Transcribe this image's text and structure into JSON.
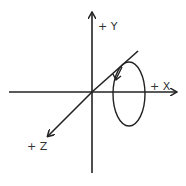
{
  "diagram": {
    "title": "",
    "type": "3d-coordinate-axes-with-rotation",
    "labels": {
      "y": "+ Y",
      "x": "+ X",
      "z": "+ Z"
    },
    "colors": {
      "stroke": "#222222",
      "text": "#333333",
      "background": "#ffffff"
    },
    "rotation": {
      "description": "elliptical loop around X axis with arrow indicating direction",
      "direction": "down-left arrow near top of loop"
    }
  }
}
